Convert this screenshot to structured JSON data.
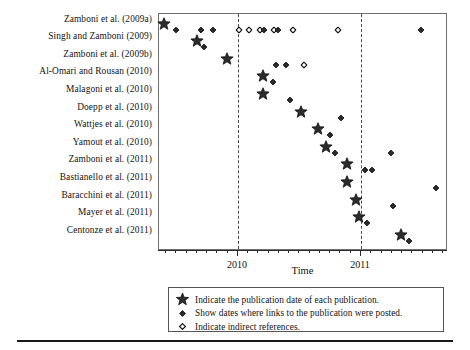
{
  "chart_data": {
    "type": "scatter",
    "title": "",
    "xlabel": "Time",
    "ylabel": "",
    "grid": false,
    "legend_position": "below-axis",
    "x_axis": {
      "tick_labels": [
        "2010",
        "2011"
      ],
      "tick_label_positions_pct": [
        27.3,
        69.9
      ],
      "range_note": "mid-2009 through late-2011, minor ticks monthly"
    },
    "marker_legend": {
      "star": "Indicate the publication date of each publication.",
      "filled_diamond": "Show dates where links to the publication were posted.",
      "open_diamond": "Indicate indirect references."
    },
    "vertical_reference_lines_pct": [
      27.3,
      69.9
    ],
    "categories": [
      "Zamboni et al. (2009a)",
      "Singh and Zamboni (2009)",
      "Zamboni et al. (2009b)",
      "Al-Omari and Rousan (2010)",
      "Malagoni et al. (2010)",
      "Doepp et al. (2010)",
      "Wattjes et al. (2010)",
      "Yamout et al. (2010)",
      "Zamboni et al. (2011)",
      "Bastianello et al. (2011)",
      "Baracchini et al. (2011)",
      "Mayer et al. (2011)",
      "Centonze et al. (2011)"
    ],
    "series": [
      {
        "name": "Zamboni et al. (2009a)",
        "row": 0,
        "points": [
          {
            "x_pct": 1.8,
            "type": "star"
          },
          {
            "x_pct": 6.0,
            "type": "filled_diamond"
          },
          {
            "x_pct": 14.6,
            "type": "filled_diamond"
          },
          {
            "x_pct": 18.8,
            "type": "filled_diamond"
          },
          {
            "x_pct": 27.8,
            "type": "open_diamond"
          },
          {
            "x_pct": 31.3,
            "type": "open_diamond"
          },
          {
            "x_pct": 34.9,
            "type": "open_diamond"
          },
          {
            "x_pct": 36.3,
            "type": "filled_diamond"
          },
          {
            "x_pct": 39.7,
            "type": "open_diamond"
          },
          {
            "x_pct": 41.2,
            "type": "filled_diamond"
          },
          {
            "x_pct": 46.4,
            "type": "open_diamond"
          },
          {
            "x_pct": 61.9,
            "type": "open_diamond"
          },
          {
            "x_pct": 90.7,
            "type": "filled_diamond"
          }
        ]
      },
      {
        "name": "Singh and Zamboni (2009)",
        "row": 1,
        "points": [
          {
            "x_pct": 13.1,
            "type": "star"
          },
          {
            "x_pct": 15.6,
            "type": "filled_diamond"
          }
        ]
      },
      {
        "name": "Zamboni et al. (2009b)",
        "row": 2,
        "points": [
          {
            "x_pct": 23.5,
            "type": "star"
          },
          {
            "x_pct": 40.5,
            "type": "filled_diamond"
          },
          {
            "x_pct": 44.0,
            "type": "filled_diamond"
          },
          {
            "x_pct": 50.2,
            "type": "open_diamond"
          }
        ]
      },
      {
        "name": "Al-Omari and Rousan (2010)",
        "row": 3,
        "points": [
          {
            "x_pct": 36.0,
            "type": "star"
          },
          {
            "x_pct": 39.4,
            "type": "filled_diamond"
          }
        ]
      },
      {
        "name": "Malagoni et al. (2010)",
        "row": 4,
        "points": [
          {
            "x_pct": 36.0,
            "type": "star"
          },
          {
            "x_pct": 45.3,
            "type": "filled_diamond"
          }
        ]
      },
      {
        "name": "Doepp et al. (2010)",
        "row": 5,
        "points": [
          {
            "x_pct": 49.1,
            "type": "star"
          },
          {
            "x_pct": 63.0,
            "type": "filled_diamond"
          }
        ]
      },
      {
        "name": "Wattjes et al. (2010)",
        "row": 6,
        "points": [
          {
            "x_pct": 55.0,
            "type": "star"
          },
          {
            "x_pct": 59.2,
            "type": "filled_diamond"
          }
        ]
      },
      {
        "name": "Yamout et al. (2010)",
        "row": 7,
        "points": [
          {
            "x_pct": 57.8,
            "type": "star"
          },
          {
            "x_pct": 60.9,
            "type": "filled_diamond"
          },
          {
            "x_pct": 80.3,
            "type": "filled_diamond"
          }
        ]
      },
      {
        "name": "Zamboni et al. (2011)",
        "row": 8,
        "points": [
          {
            "x_pct": 65.1,
            "type": "star"
          },
          {
            "x_pct": 71.3,
            "type": "filled_diamond"
          },
          {
            "x_pct": 73.7,
            "type": "filled_diamond"
          }
        ]
      },
      {
        "name": "Bastianello et al. (2011)",
        "row": 9,
        "points": [
          {
            "x_pct": 65.1,
            "type": "star"
          },
          {
            "x_pct": 95.8,
            "type": "filled_diamond"
          }
        ]
      },
      {
        "name": "Baracchini et al. (2011)",
        "row": 10,
        "points": [
          {
            "x_pct": 68.2,
            "type": "star"
          },
          {
            "x_pct": 81.0,
            "type": "filled_diamond"
          }
        ]
      },
      {
        "name": "Mayer et al. (2011)",
        "row": 11,
        "points": [
          {
            "x_pct": 69.2,
            "type": "star"
          },
          {
            "x_pct": 72.0,
            "type": "filled_diamond"
          }
        ]
      },
      {
        "name": "Centonze et al. (2011)",
        "row": 12,
        "points": [
          {
            "x_pct": 83.7,
            "type": "star"
          },
          {
            "x_pct": 86.5,
            "type": "filled_diamond"
          }
        ]
      }
    ]
  },
  "axis": {
    "x_title": "Time",
    "x_tick_2010": "2010",
    "x_tick_2011": "2011"
  },
  "legend": {
    "items": [
      {
        "symbol": "star",
        "text": "Indicate the publication date of each publication."
      },
      {
        "symbol": "filled_diamond",
        "text": "Show dates where links to the publication were posted."
      },
      {
        "symbol": "open_diamond",
        "text": "Indicate indirect references."
      }
    ]
  },
  "colors": {
    "marker_fill": "#2b2b2b",
    "marker_stroke": "#111111",
    "frame": "#6f6f6f",
    "axis": "#2b2b2b",
    "text": "#131313"
  }
}
